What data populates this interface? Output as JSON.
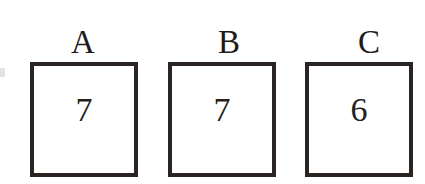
{
  "figure": {
    "background_color": "#ffffff",
    "border_color": "#2a2522",
    "text_color": "#241f1c",
    "border_width_px": 4
  },
  "boxes": [
    {
      "label": "A",
      "value": "7"
    },
    {
      "label": "B",
      "value": "7"
    },
    {
      "label": "C",
      "value": "6"
    }
  ]
}
